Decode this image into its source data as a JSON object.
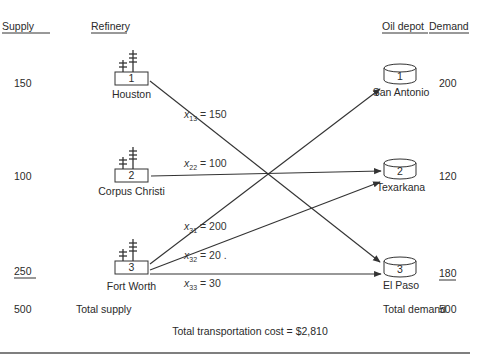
{
  "headers": {
    "supply": "Supply",
    "refinery": "Refinery",
    "oil_depot": "Oil depot",
    "demand": "Demand"
  },
  "refineries": [
    {
      "id": "1",
      "name": "Houston",
      "supply": "150"
    },
    {
      "id": "2",
      "name": "Corpus Christi",
      "supply": "100"
    },
    {
      "id": "3",
      "name": "Fort Worth",
      "supply": "250"
    }
  ],
  "depots": [
    {
      "id": "1",
      "name": "San Antonio",
      "demand": "200"
    },
    {
      "id": "2",
      "name": "Texarkana",
      "demand": "120"
    },
    {
      "id": "3",
      "name": "El Paso",
      "demand": "180"
    }
  ],
  "flows": [
    {
      "var": "x",
      "sub": "13",
      "from": "1",
      "to": "3",
      "value": "150",
      "text": "= 150"
    },
    {
      "var": "x",
      "sub": "22",
      "from": "2",
      "to": "2",
      "value": "100",
      "text": "= 100"
    },
    {
      "var": "x",
      "sub": "31",
      "from": "3",
      "to": "1",
      "value": "200",
      "text": "= 200"
    },
    {
      "var": "x",
      "sub": "32",
      "from": "3",
      "to": "2",
      "value": "20",
      "text": "= 20 ."
    },
    {
      "var": "x",
      "sub": "33",
      "from": "3",
      "to": "3",
      "value": "30",
      "text": "= 30"
    }
  ],
  "totals": {
    "supply_value": "500",
    "supply_label": "Total supply",
    "demand_label": "Total demand",
    "demand_value": "500",
    "cost_text": "Total transportation cost = $2,810"
  },
  "colors": {
    "ink": "#2a2a2a",
    "background": "#ffffff",
    "rule": "#555555"
  }
}
